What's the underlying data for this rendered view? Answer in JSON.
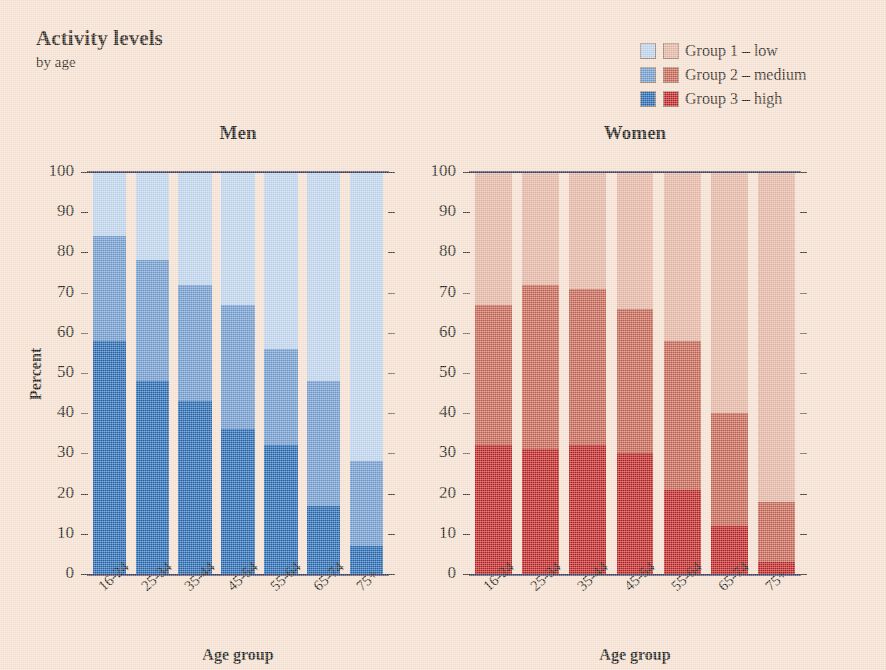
{
  "header": {
    "title": "Activity levels",
    "subtitle": "by age"
  },
  "legend": {
    "items": [
      {
        "label": "Group 1 – low",
        "men_color": "#b8cfe8",
        "women_color": "#e0b09e"
      },
      {
        "label": "Group 2 – medium",
        "men_color": "#6a95c8",
        "women_color": "#bf5e4c"
      },
      {
        "label": "Group 3 – high",
        "men_color": "#1f62aa",
        "women_color": "#b71c1c"
      }
    ]
  },
  "panels": [
    {
      "title": "Men"
    },
    {
      "title": "Women"
    }
  ],
  "axes": {
    "ylabel": "Percent",
    "xlabel": "Age group",
    "ytick_labels": [
      "0",
      "10",
      "20",
      "30",
      "40",
      "50",
      "60",
      "70",
      "80",
      "90",
      "100"
    ],
    "xtick_labels": [
      "16-24",
      "25-34",
      "35-44",
      "45-54",
      "55-64",
      "65-74",
      "75+"
    ],
    "ylim": [
      0,
      100
    ]
  },
  "chart_data": {
    "type": "bar",
    "title": "Activity levels",
    "subtitle": "by age",
    "xlabel": "Age group",
    "ylabel": "Percent",
    "ylim": [
      0,
      100
    ],
    "grid": false,
    "stacked": true,
    "legend_position": "top-right",
    "categories": [
      "16-24",
      "25-34",
      "35-44",
      "45-54",
      "55-64",
      "65-74",
      "75+"
    ],
    "panels": [
      {
        "name": "Men",
        "colors": {
          "low": "#b8cfe8",
          "medium": "#6a95c8",
          "high": "#1f62aa"
        },
        "series": [
          {
            "name": "Group 3 – high",
            "values": [
              58,
              48,
              43,
              36,
              32,
              17,
              7
            ]
          },
          {
            "name": "Group 2 – medium",
            "values": [
              26,
              30,
              29,
              31,
              24,
              31,
              21
            ]
          },
          {
            "name": "Group 1 – low",
            "values": [
              16,
              22,
              28,
              33,
              44,
              52,
              72
            ]
          }
        ],
        "cumulative_tops": {
          "high": [
            58,
            48,
            43,
            36,
            32,
            17,
            7
          ],
          "medium": [
            84,
            78,
            72,
            67,
            56,
            48,
            28
          ],
          "low": [
            100,
            100,
            100,
            100,
            100,
            100,
            100
          ]
        }
      },
      {
        "name": "Women",
        "colors": {
          "low": "#e0b09e",
          "medium": "#bf5e4c",
          "high": "#b71c1c"
        },
        "series": [
          {
            "name": "Group 3 – high",
            "values": [
              32,
              31,
              32,
              30,
              21,
              12,
              3
            ]
          },
          {
            "name": "Group 2 – medium",
            "values": [
              35,
              41,
              39,
              36,
              37,
              28,
              15
            ]
          },
          {
            "name": "Group 1 – low",
            "values": [
              33,
              28,
              29,
              34,
              42,
              60,
              82
            ]
          }
        ],
        "cumulative_tops": {
          "high": [
            32,
            31,
            32,
            30,
            21,
            12,
            3
          ],
          "medium": [
            67,
            72,
            71,
            66,
            58,
            40,
            18
          ],
          "low": [
            100,
            100,
            100,
            100,
            100,
            100,
            100
          ]
        }
      }
    ]
  }
}
